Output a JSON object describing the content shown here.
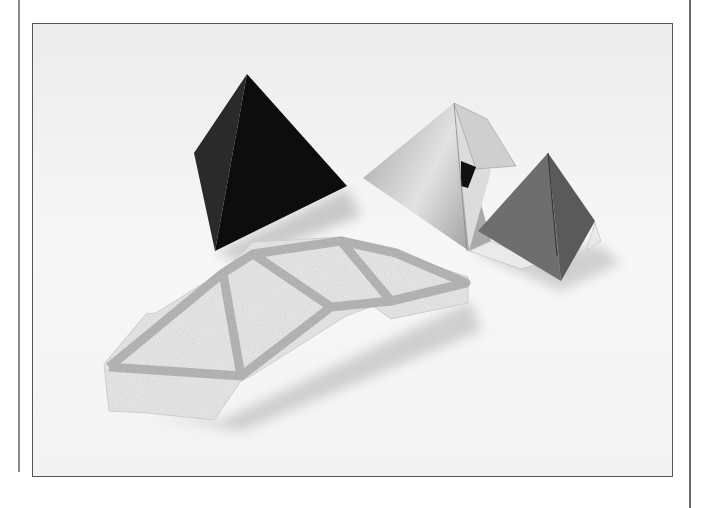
{
  "page": {
    "type": "printed-figure",
    "background": "#ffffff"
  },
  "figure": {
    "frame_color": "#555555",
    "backdrop_color": "#f2f2f2",
    "objects": [
      {
        "name": "black-tetrahedron",
        "color": "#111111"
      },
      {
        "name": "silver-tetrahedron",
        "color": "#c8c8c8"
      },
      {
        "name": "gray-tetrahedron",
        "color": "#6e6e6e"
      },
      {
        "name": "crayon-net",
        "color": "#e6e6e6",
        "stroke_color": "#a9a9a9"
      }
    ]
  }
}
